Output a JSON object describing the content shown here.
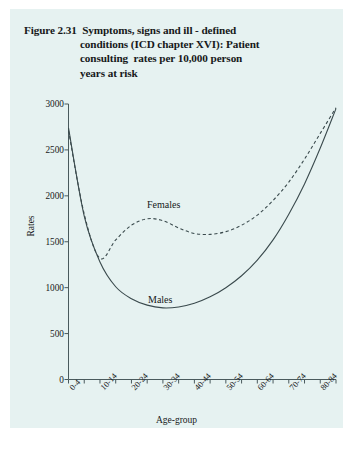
{
  "figure": {
    "title_lines": [
      "Figure 2.31  Symptoms, signs and ill - defined",
      "conditions (ICD chapter XVI): Patient",
      "consulting  rates per 10,000 person",
      "years at risk"
    ],
    "background_color": "#e6f2f1",
    "ink_color": "#3a4a4d"
  },
  "chart_data": {
    "type": "line",
    "title": "Figure 2.31  Symptoms, signs and ill - defined conditions (ICD chapter XVI): Patient consulting  rates per 10,000 person years at risk",
    "xlabel": "Age-group",
    "ylabel": "Rates",
    "ylim": [
      0,
      3000
    ],
    "ytick_values": [
      0,
      500,
      1000,
      1500,
      2000,
      2500,
      3000
    ],
    "ytick_labels": [
      "0",
      "500",
      "1000",
      "1500",
      "2000",
      "2500",
      "3000"
    ],
    "grid": false,
    "legend": "inline-annotation",
    "categories": [
      "0-4",
      "5-9",
      "10-14",
      "15-19",
      "20-24",
      "25-29",
      "30-34",
      "35-39",
      "40-44",
      "45-49",
      "50-54",
      "55-59",
      "60-64",
      "65-69",
      "70-74",
      "75-79",
      "80-84",
      "85+"
    ],
    "xtick_labels_shown": [
      "0-4",
      "10-14",
      "20-24",
      "30-34",
      "40-44",
      "50-54",
      "60-64",
      "70-74",
      "80-84"
    ],
    "series": [
      {
        "name": "Males",
        "style": "solid",
        "label_text": "Males",
        "values": [
          2740,
          1780,
          1280,
          1010,
          880,
          810,
          780,
          790,
          830,
          900,
          1000,
          1130,
          1300,
          1520,
          1800,
          2130,
          2520,
          2950
        ]
      },
      {
        "name": "Females",
        "style": "dashed",
        "label_text": "Females",
        "values": [
          2710,
          1800,
          1320,
          1520,
          1680,
          1750,
          1730,
          1650,
          1590,
          1580,
          1610,
          1680,
          1790,
          1950,
          2150,
          2400,
          2680,
          2960
        ]
      }
    ]
  }
}
